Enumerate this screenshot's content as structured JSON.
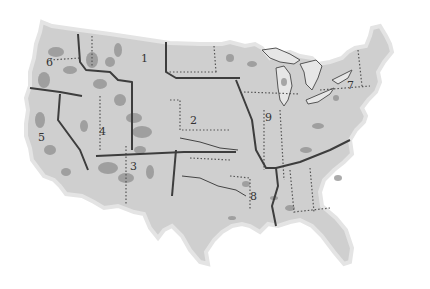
{
  "map": {
    "title": "",
    "colors": {
      "land": "#cfcfcf",
      "forest_patches": "#8f8f8f",
      "region_boundary": "#3d3d3d",
      "state_boundary": "#555555",
      "water": "#e6e6e6",
      "background": "#ffffff"
    },
    "regions": [
      {
        "id": "1",
        "label": "1",
        "x": 144,
        "y": 62
      },
      {
        "id": "2",
        "label": "2",
        "x": 193,
        "y": 124
      },
      {
        "id": "3",
        "label": "3",
        "x": 133,
        "y": 170
      },
      {
        "id": "4",
        "label": "4",
        "x": 102,
        "y": 135
      },
      {
        "id": "5",
        "label": "5",
        "x": 41,
        "y": 141
      },
      {
        "id": "6",
        "label": "6",
        "x": 49,
        "y": 66
      },
      {
        "id": "7",
        "label": "7",
        "x": 350,
        "y": 89
      },
      {
        "id": "8",
        "label": "8",
        "x": 253,
        "y": 200
      },
      {
        "id": "9",
        "label": "9",
        "x": 268,
        "y": 121
      }
    ]
  }
}
